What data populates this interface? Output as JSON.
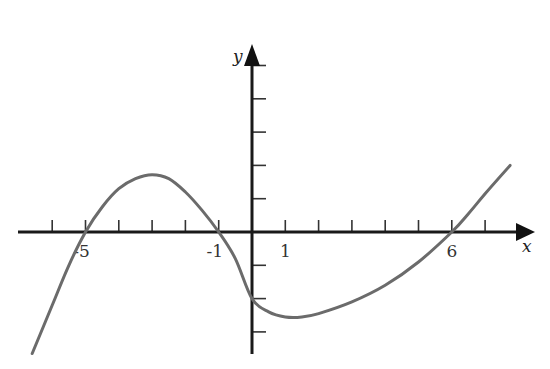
{
  "chart_data": {
    "type": "line",
    "title": "",
    "xlabel": "x",
    "ylabel": "y",
    "x_tick_labels": [
      {
        "value": -5,
        "label": "-5"
      },
      {
        "value": -1,
        "label": "-1"
      },
      {
        "value": 1,
        "label": "1"
      },
      {
        "value": 6,
        "label": "6"
      }
    ],
    "x_ticks": [
      -6,
      -5,
      -4,
      -3,
      -2,
      -1,
      1,
      2,
      3,
      4,
      5,
      6,
      7
    ],
    "y_ticks": [
      -3,
      -2,
      -1,
      1,
      2,
      3,
      4,
      5
    ],
    "xlim": [
      -7.1,
      8.5
    ],
    "ylim": [
      -3.6,
      5.6
    ],
    "grid": false,
    "legend": null,
    "series": [
      {
        "name": "f(x)",
        "color": "#6b6b6b",
        "description": "cubic curve with x-intercepts at -5, -1, 6 and y-intercept about -2",
        "x_intercepts": [
          -5,
          -1,
          6
        ],
        "y_intercept": -2,
        "local_max": {
          "x": -2.9,
          "y": 1.7
        },
        "local_min": {
          "x": 1.35,
          "y": -2.55
        },
        "points": [
          [
            -6.6,
            -3.65
          ],
          [
            -6.0,
            -2.2
          ],
          [
            -5.5,
            -1.0
          ],
          [
            -5.0,
            0.0
          ],
          [
            -4.5,
            0.75
          ],
          [
            -4.0,
            1.3
          ],
          [
            -3.5,
            1.6
          ],
          [
            -3.0,
            1.72
          ],
          [
            -2.5,
            1.6
          ],
          [
            -2.0,
            1.2
          ],
          [
            -1.5,
            0.65
          ],
          [
            -1.0,
            0.0
          ],
          [
            -0.5,
            -0.8
          ],
          [
            0.0,
            -2.0
          ],
          [
            0.5,
            -2.4
          ],
          [
            1.0,
            -2.55
          ],
          [
            1.5,
            -2.55
          ],
          [
            2.0,
            -2.45
          ],
          [
            3.0,
            -2.1
          ],
          [
            4.0,
            -1.6
          ],
          [
            5.0,
            -0.9
          ],
          [
            6.0,
            0.0
          ],
          [
            6.5,
            0.55
          ],
          [
            7.0,
            1.15
          ],
          [
            7.75,
            2.0
          ]
        ]
      }
    ]
  },
  "axes": {
    "x_label": "x",
    "y_label": "y"
  }
}
